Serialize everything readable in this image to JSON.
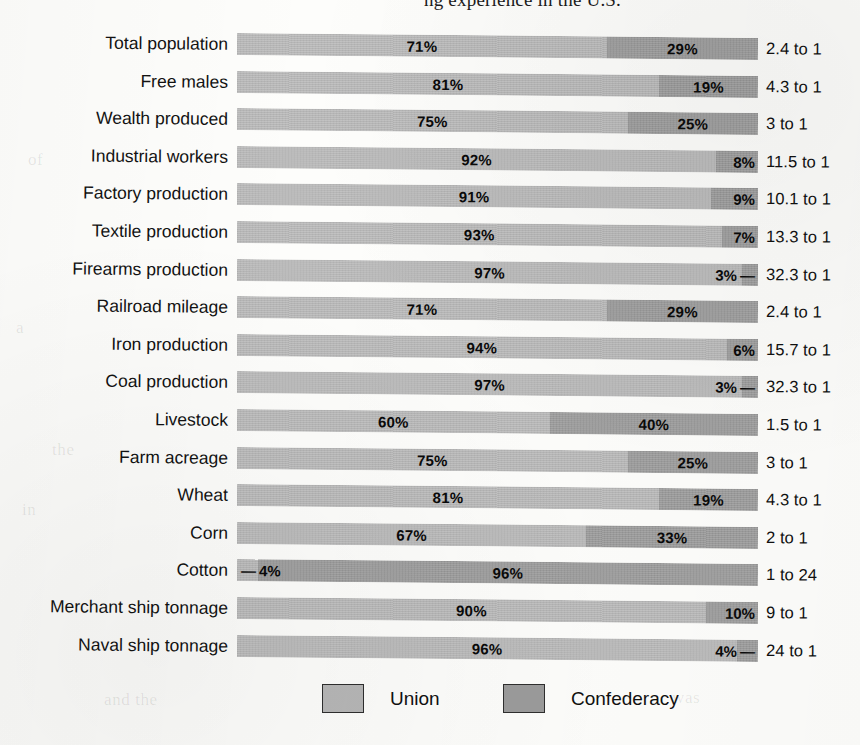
{
  "top_caption": "ng experience in the U.S.",
  "legend": {
    "items": [
      {
        "label": "Union",
        "color": "#b6b6b6",
        "icon": "legend-swatch-icon"
      },
      {
        "label": "Confederacy",
        "color": "#9b9b9b",
        "icon": "legend-swatch-icon"
      }
    ]
  },
  "colors": {
    "union": "#b6b6b6",
    "confederacy": "#9b9b9b",
    "text": "#111111",
    "paper": "#fdfdfb"
  },
  "bleed_text": [
    {
      "text": "of",
      "x": 28,
      "y": 150
    },
    {
      "text": "a",
      "x": 16,
      "y": 318
    },
    {
      "text": "the",
      "x": 52,
      "y": 440
    },
    {
      "text": "in",
      "x": 22,
      "y": 500
    },
    {
      "text": "and the",
      "x": 104,
      "y": 690
    },
    {
      "text": "was",
      "x": 672,
      "y": 688
    }
  ],
  "chart_data": {
    "type": "bar",
    "subtype": "stacked-100-horizontal",
    "title": "",
    "xlabel": "",
    "ylabel": "",
    "xlim": [
      0,
      100
    ],
    "grid": false,
    "legend_position": "bottom",
    "categories": [
      "Total population",
      "Free males",
      "Wealth produced",
      "Industrial workers",
      "Factory production",
      "Textile production",
      "Firearms production",
      "Railroad mileage",
      "Iron production",
      "Coal production",
      "Livestock",
      "Farm acreage",
      "Wheat",
      "Corn",
      "Cotton",
      "Merchant ship tonnage",
      "Naval ship tonnage"
    ],
    "series": [
      {
        "name": "Union",
        "color": "#b6b6b6",
        "values": [
          71,
          81,
          75,
          92,
          91,
          93,
          97,
          71,
          94,
          97,
          60,
          75,
          81,
          67,
          4,
          90,
          96
        ]
      },
      {
        "name": "Confederacy",
        "color": "#9b9b9b",
        "values": [
          29,
          19,
          25,
          8,
          9,
          7,
          3,
          29,
          6,
          3,
          40,
          25,
          19,
          33,
          96,
          10,
          4
        ]
      }
    ],
    "rows": [
      {
        "label": "Total population",
        "union": 71,
        "confederacy": 29,
        "union_text": "71%",
        "confederacy_text": "29%",
        "ratio": "2.4 to 1",
        "union_outside": false,
        "conf_outside": false
      },
      {
        "label": "Free males",
        "union": 81,
        "confederacy": 19,
        "union_text": "81%",
        "confederacy_text": "19%",
        "ratio": "4.3 to 1",
        "union_outside": false,
        "conf_outside": false
      },
      {
        "label": "Wealth produced",
        "union": 75,
        "confederacy": 25,
        "union_text": "75%",
        "confederacy_text": "25%",
        "ratio": "3 to 1",
        "union_outside": false,
        "conf_outside": false
      },
      {
        "label": "Industrial workers",
        "union": 92,
        "confederacy": 8,
        "union_text": "92%",
        "confederacy_text": "8%",
        "ratio": "11.5 to 1",
        "union_outside": false,
        "conf_outside": true
      },
      {
        "label": "Factory production",
        "union": 91,
        "confederacy": 9,
        "union_text": "91%",
        "confederacy_text": "9%",
        "ratio": "10.1 to 1",
        "union_outside": false,
        "conf_outside": true
      },
      {
        "label": "Textile production",
        "union": 93,
        "confederacy": 7,
        "union_text": "93%",
        "confederacy_text": "7%",
        "ratio": "13.3 to 1",
        "union_outside": false,
        "conf_outside": true
      },
      {
        "label": "Firearms production",
        "union": 97,
        "confederacy": 3,
        "union_text": "97%",
        "confederacy_text": "3% —",
        "ratio": "32.3 to 1",
        "union_outside": false,
        "conf_outside": true
      },
      {
        "label": "Railroad mileage",
        "union": 71,
        "confederacy": 29,
        "union_text": "71%",
        "confederacy_text": "29%",
        "ratio": "2.4 to 1",
        "union_outside": false,
        "conf_outside": false
      },
      {
        "label": "Iron production",
        "union": 94,
        "confederacy": 6,
        "union_text": "94%",
        "confederacy_text": "6%",
        "ratio": "15.7 to 1",
        "union_outside": false,
        "conf_outside": true
      },
      {
        "label": "Coal production",
        "union": 97,
        "confederacy": 3,
        "union_text": "97%",
        "confederacy_text": "3% —",
        "ratio": "32.3 to 1",
        "union_outside": false,
        "conf_outside": true
      },
      {
        "label": "Livestock",
        "union": 60,
        "confederacy": 40,
        "union_text": "60%",
        "confederacy_text": "40%",
        "ratio": "1.5 to 1",
        "union_outside": false,
        "conf_outside": false
      },
      {
        "label": "Farm acreage",
        "union": 75,
        "confederacy": 25,
        "union_text": "75%",
        "confederacy_text": "25%",
        "ratio": "3 to 1",
        "union_outside": false,
        "conf_outside": false
      },
      {
        "label": "Wheat",
        "union": 81,
        "confederacy": 19,
        "union_text": "81%",
        "confederacy_text": "19%",
        "ratio": "4.3 to 1",
        "union_outside": false,
        "conf_outside": false
      },
      {
        "label": "Corn",
        "union": 67,
        "confederacy": 33,
        "union_text": "67%",
        "confederacy_text": "33%",
        "ratio": "2 to 1",
        "union_outside": false,
        "conf_outside": false
      },
      {
        "label": "Cotton",
        "union": 4,
        "confederacy": 96,
        "union_text": "— 4%",
        "confederacy_text": "96%",
        "ratio": "1 to 24",
        "union_outside": true,
        "conf_outside": false
      },
      {
        "label": "Merchant ship tonnage",
        "union": 90,
        "confederacy": 10,
        "union_text": "90%",
        "confederacy_text": "10%",
        "ratio": "9 to 1",
        "union_outside": false,
        "conf_outside": true
      },
      {
        "label": "Naval ship tonnage",
        "union": 96,
        "confederacy": 4,
        "union_text": "96%",
        "confederacy_text": "4% —",
        "ratio": "24 to 1",
        "union_outside": false,
        "conf_outside": true
      }
    ]
  }
}
